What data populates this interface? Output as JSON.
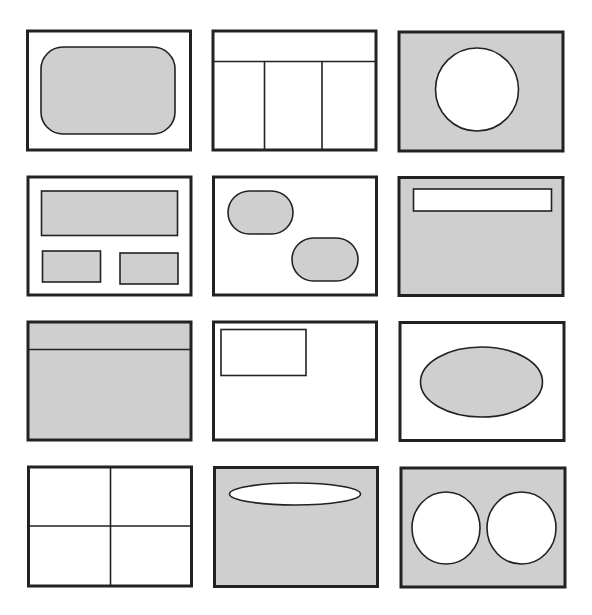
{
  "diagram": {
    "title": "",
    "colors": {
      "background": "#ffffff",
      "stroke": "#222222",
      "fill_gray": "#cfcfcf",
      "fill_white": "#ffffff"
    },
    "grid": {
      "rows": 4,
      "cols": 3
    },
    "panels": [
      {
        "id": "r1c1",
        "bg": "white",
        "content": "gray rounded rectangle centered"
      },
      {
        "id": "r1c2",
        "bg": "white",
        "content": "top header band with three vertical columns below"
      },
      {
        "id": "r1c3",
        "bg": "gray",
        "content": "white circle centered"
      },
      {
        "id": "r2c1",
        "bg": "white",
        "content": "wide gray rectangle on top, two small gray rectangles below"
      },
      {
        "id": "r2c2",
        "bg": "white",
        "content": "two gray pill/ovals diagonally placed"
      },
      {
        "id": "r2c3",
        "bg": "gray",
        "content": "white horizontal bar at top"
      },
      {
        "id": "r3c1",
        "bg": "gray",
        "content": "gray panel with horizontal divider near top"
      },
      {
        "id": "r3c2",
        "bg": "white",
        "content": "small outlined rectangle in upper-left"
      },
      {
        "id": "r3c3",
        "bg": "white",
        "content": "gray ellipse centered"
      },
      {
        "id": "r4c1",
        "bg": "white",
        "content": "four equal quadrants"
      },
      {
        "id": "r4c2",
        "bg": "gray",
        "content": "thin white ellipse at top"
      },
      {
        "id": "r4c3",
        "bg": "gray",
        "content": "two white circles side by side"
      }
    ]
  }
}
